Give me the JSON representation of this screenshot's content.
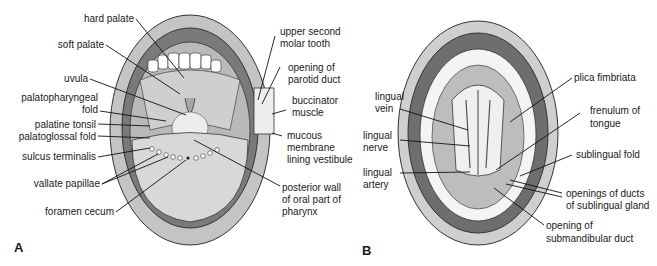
{
  "panels": [
    {
      "id": "A",
      "letter": "A",
      "labels_left": [
        "hard palate",
        "soft palate",
        "uvula",
        "palatopharyngeal",
        "fold",
        "palatine tonsil",
        "palatoglossal fold",
        "sulcus terminalis",
        "vallate papillae",
        "foramen cecum"
      ],
      "labels_right": [
        "upper second",
        "molar tooth",
        "opening of",
        "parotid duct",
        "buccinator",
        "muscle",
        "mucous",
        "membrane",
        "lining vestibule",
        "posterior wall",
        "of oral part of",
        "pharynx"
      ]
    },
    {
      "id": "B",
      "letter": "B",
      "labels_left": [
        "lingual",
        "vein",
        "lingual",
        "nerve",
        "lingual",
        "artery"
      ],
      "labels_right": [
        "plica fimbriata",
        "frenulum of",
        "tongue",
        "sublingual fold",
        "openings of ducts",
        "of sublingual gland",
        "opening of",
        "submandibular duct"
      ]
    }
  ],
  "colors": {
    "lip_gray": "#b8b8b8",
    "gum_dark": "#6e6e6e",
    "tongue": "#d0d0d0",
    "line": "#111111"
  }
}
